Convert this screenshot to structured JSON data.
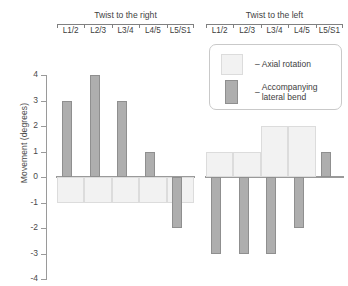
{
  "chart_data": {
    "type": "bar",
    "title": "",
    "xlabel": "",
    "ylabel": "Movement (degrees)",
    "ylim": [
      -4,
      4
    ],
    "ytick_labels": [
      "4",
      "3",
      "2",
      "1",
      "0",
      "-1",
      "-2",
      "-3",
      "-4"
    ],
    "ytick_values": [
      4,
      3,
      2,
      1,
      0,
      -1,
      -2,
      -3,
      -4
    ],
    "grid": false,
    "legend_position": "top-right",
    "categories": [
      "L1/2",
      "L2/3",
      "L3/4",
      "L4/5",
      "L5/S1"
    ],
    "panels": [
      {
        "name": "Twist to the right",
        "title": "Twist to the right",
        "categories": [
          "L1/2",
          "L2/3",
          "L3/4",
          "L4/5",
          "L5/S1"
        ],
        "series": [
          {
            "name": "Axial rotation",
            "values": [
              -1,
              -1,
              -1,
              -1,
              -1
            ]
          },
          {
            "name": "Accompanying lateral bend",
            "values": [
              3,
              4,
              3,
              1,
              -2
            ]
          }
        ]
      },
      {
        "name": "Twist to the left",
        "title": "Twist to the left",
        "categories": [
          "L1/2",
          "L2/3",
          "L3/4",
          "L4/5",
          "L5/S1"
        ],
        "series": [
          {
            "name": "Axial rotation",
            "values": [
              1,
              1,
              2,
              2,
              0
            ]
          },
          {
            "name": "Accompanying lateral bend",
            "values": [
              -3,
              -3,
              -3,
              -2,
              1
            ]
          }
        ]
      }
    ],
    "legend": [
      {
        "label": "Axial rotation",
        "dash": "–",
        "color": "#f2f2f2"
      },
      {
        "label": "Accompanying\nlateral bend",
        "dash": "–",
        "color": "#aeaeae"
      }
    ],
    "colors": {
      "axial_rotation_fill": "#f2f2f2",
      "axial_rotation_border": "#dcdcdc",
      "lateral_bend_fill": "#aeaeae",
      "lateral_bend_border": "#8f8f8f",
      "axis": "#9a9a9a",
      "text": "#3d3d3d",
      "background": "#ffffff"
    }
  }
}
